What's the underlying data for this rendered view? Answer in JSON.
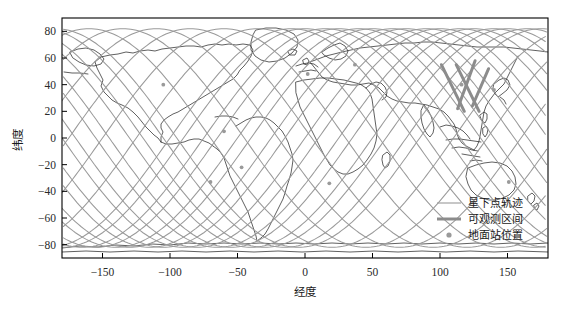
{
  "figure": {
    "background_color": "#ffffff",
    "plot_area": {
      "left": 62,
      "top": 18,
      "right": 548,
      "bottom": 258
    },
    "frame_color": "#000000"
  },
  "axes": {
    "x": {
      "label": "经度",
      "ticks": [
        -150,
        -100,
        -50,
        0,
        50,
        100,
        150
      ],
      "tick_labels": [
        "-150",
        "-100",
        "-50",
        "0",
        "50",
        "100",
        "150"
      ],
      "range": [
        -180,
        180
      ]
    },
    "y": {
      "label": "纬度",
      "ticks": [
        80,
        60,
        40,
        20,
        0,
        -20,
        -40,
        -60,
        -80
      ],
      "tick_labels": [
        "80",
        "60",
        "40",
        "20",
        "0",
        "-20",
        "-40",
        "-60",
        "-80"
      ],
      "range": [
        -90,
        90
      ]
    }
  },
  "legend": {
    "position": "bottom-right",
    "items": [
      {
        "label": "星下点轨迹",
        "marker": "line-thin",
        "color": "#9a9a9a",
        "width": 1.1
      },
      {
        "label": "可观测区间",
        "marker": "line-thick",
        "color": "#8c8c8c",
        "width": 3.0
      },
      {
        "label": "地面站位置",
        "marker": "dot",
        "color": "#9a9a9a",
        "size": 4
      }
    ]
  },
  "chart_data": {
    "type": "line",
    "title": "",
    "xlabel": "经度",
    "ylabel": "纬度",
    "xlim": [
      -180,
      180
    ],
    "ylim": [
      -90,
      90
    ],
    "grid": false,
    "legend_position": "lower right",
    "series": [
      {
        "name": "星下点轨迹",
        "type": "groundtrack",
        "color": "#9a9a9a",
        "linewidth": 1.1,
        "description": "Sinusoidal sub-satellite point ground tracks, inclination ~82 degrees, repeating with a westward drift of about 25 degrees longitude per orbit; 15 full ascending/descending sweeps across the 360-degree longitude span.",
        "inclination_deg": 82,
        "num_orbits": 15,
        "longitude_drift_per_orbit_deg": 25.0,
        "amplitude_deg": 82
      },
      {
        "name": "可观测区间",
        "type": "highlight-segments",
        "color": "#8c8c8c",
        "linewidth": 3.0,
        "description": "Thick highlighted arcs of the ground track over East Asia, roughly 100-135 degrees E and 20-55 degrees N, marking the observable visibility windows.",
        "segments": [
          {
            "lon_start": 101,
            "lat_start": 55,
            "lon_end": 118,
            "lat_end": 20
          },
          {
            "lon_start": 112,
            "lat_start": 55,
            "lon_end": 129,
            "lat_end": 20
          },
          {
            "lon_start": 126,
            "lat_start": 58,
            "lon_end": 113,
            "lat_end": 22
          },
          {
            "lon_start": 136,
            "lat_start": 52,
            "lon_end": 124,
            "lat_end": 24
          }
        ]
      },
      {
        "name": "地面站位置",
        "type": "scatter",
        "color": "#9a9a9a",
        "marker": "dot",
        "markersize": 4,
        "points": [
          {
            "lon": -105,
            "lat": 40
          },
          {
            "lon": -60,
            "lat": 5
          },
          {
            "lon": -47,
            "lat": -22
          },
          {
            "lon": -70,
            "lat": -33
          },
          {
            "lon": 2,
            "lat": 48
          },
          {
            "lon": 37,
            "lat": 55
          },
          {
            "lon": 116,
            "lat": 40
          },
          {
            "lon": 140,
            "lat": 36
          },
          {
            "lon": 151,
            "lat": -33
          },
          {
            "lon": 18,
            "lat": -34
          }
        ]
      },
      {
        "name": "世界地图海岸线",
        "type": "coastline",
        "color": "#2b2b2b",
        "linewidth": 0.7,
        "description": "World coastline outlines drawn in a plate carree (equirectangular) projection behind the ground tracks."
      }
    ]
  }
}
